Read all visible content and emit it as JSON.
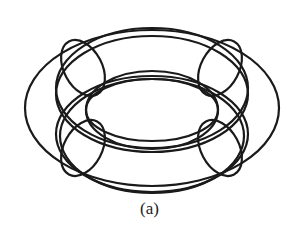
{
  "figure": {
    "caption": "(a)",
    "stroke_color": "#1a1a1a",
    "stroke_width": 2.2,
    "ellipses": [
      {
        "name": "outer-wide",
        "cx": 152,
        "cy": 108,
        "rx": 127,
        "ry": 78,
        "rot": 0
      },
      {
        "name": "outer-top-ring",
        "cx": 152,
        "cy": 88,
        "rx": 96,
        "ry": 60,
        "rot": 0
      },
      {
        "name": "outer-top-ring-2",
        "cx": 152,
        "cy": 94,
        "rx": 96,
        "ry": 58,
        "rot": 0
      },
      {
        "name": "outer-bottom-ring",
        "cx": 152,
        "cy": 134,
        "rx": 96,
        "ry": 58,
        "rot": 0
      },
      {
        "name": "outer-bottom-ring-2",
        "cx": 152,
        "cy": 136,
        "rx": 92,
        "ry": 57,
        "rot": 0
      },
      {
        "name": "inner-top",
        "cx": 152,
        "cy": 110,
        "rx": 66,
        "ry": 39,
        "rot": 0
      },
      {
        "name": "inner-bottom",
        "cx": 152,
        "cy": 110,
        "rx": 66,
        "ry": 31,
        "rot": 0
      },
      {
        "name": "cross-section-top-left",
        "cx": 83,
        "cy": 68,
        "rx": 19,
        "ry": 30,
        "rot": -28
      },
      {
        "name": "cross-section-bottom-left",
        "cx": 83,
        "cy": 148,
        "rx": 19,
        "ry": 30,
        "rot": 28
      },
      {
        "name": "cross-section-top-right",
        "cx": 220,
        "cy": 68,
        "rx": 19,
        "ry": 30,
        "rot": 28
      },
      {
        "name": "cross-section-bottom-right",
        "cx": 220,
        "cy": 148,
        "rx": 19,
        "ry": 30,
        "rot": -28
      }
    ]
  }
}
